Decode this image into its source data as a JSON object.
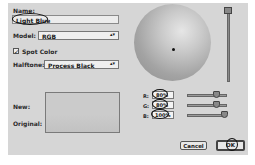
{
  "dialog": {
    "name_label": "Name:",
    "name_value": "Light Blue",
    "model_label": "Model:",
    "model_value": "RGB",
    "spot_color_label": "Spot Color",
    "spot_color_checked": true,
    "halftone_label": "Halftone:",
    "halftone_value": "Process Black",
    "new_label": "New:",
    "original_label": "Original:",
    "select_arrows": "▴▾"
  },
  "rgb": {
    "r_label": "R:",
    "r_value": "80%",
    "g_label": "G:",
    "g_value": "80%",
    "b_label": "B:",
    "b_value": "100%"
  },
  "buttons": {
    "cancel": "Cancel",
    "ok": "OK"
  },
  "checkmark": "✓"
}
